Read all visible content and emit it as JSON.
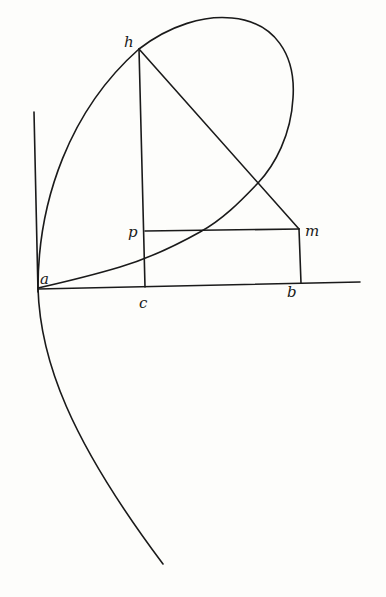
{
  "diagram": {
    "type": "geometric-construction",
    "background": "#fdfdfb",
    "ink_color": "#1a1a1a",
    "points": {
      "a": {
        "label": "a",
        "x": 38,
        "y": 288
      },
      "h": {
        "label": "h",
        "x": 139,
        "y": 49
      },
      "p": {
        "label": "p",
        "x": 145,
        "y": 231
      },
      "m": {
        "label": "m",
        "x": 299,
        "y": 229
      },
      "b": {
        "label": "b",
        "x": 301,
        "y": 283
      },
      "c": {
        "label": "c",
        "x": 145,
        "y": 287
      }
    },
    "labels": [
      {
        "id": "a",
        "text": "a",
        "x": 40,
        "y": 284
      },
      {
        "id": "h",
        "text": "h",
        "x": 124,
        "y": 47
      },
      {
        "id": "p",
        "text": "p",
        "x": 128,
        "y": 237
      },
      {
        "id": "m",
        "text": "m",
        "x": 305,
        "y": 236
      },
      {
        "id": "b",
        "text": "b",
        "x": 287,
        "y": 297
      },
      {
        "id": "c",
        "text": "c",
        "x": 139,
        "y": 308
      }
    ],
    "segments": [
      {
        "name": "vertical-axis",
        "from": [
          34,
          112
        ],
        "to": [
          38,
          292
        ]
      },
      {
        "name": "horizontal-axis",
        "from": [
          38,
          289
        ],
        "to": [
          360,
          282
        ]
      },
      {
        "name": "line-hc",
        "from": [
          139,
          49
        ],
        "to": [
          145,
          287
        ]
      },
      {
        "name": "line-hm",
        "from": [
          139,
          49
        ],
        "to": [
          299,
          229
        ]
      },
      {
        "name": "line-pm",
        "from": [
          145,
          231
        ],
        "to": [
          299,
          229
        ]
      },
      {
        "name": "line-mb",
        "from": [
          299,
          229
        ],
        "to": [
          301,
          283
        ]
      }
    ],
    "curves": [
      {
        "name": "loop-curve",
        "description": "closed loop from a through h, around right, back to a"
      },
      {
        "name": "lower-branch-curve",
        "description": "branch descending from a to lower left"
      }
    ]
  }
}
